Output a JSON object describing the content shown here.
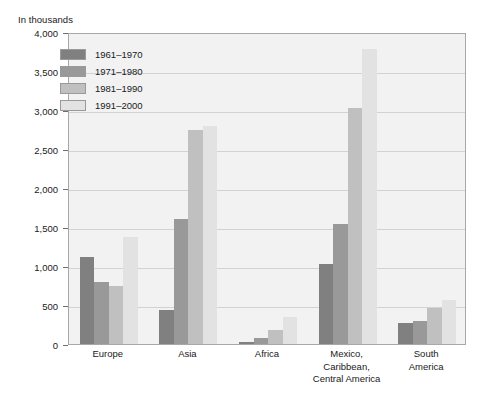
{
  "chart_data": {
    "type": "bar",
    "title": "",
    "subtitle": "",
    "axis_unit_caption": "In thousands",
    "xlabel": "",
    "ylabel": "",
    "ylim": [
      0,
      4000
    ],
    "ytick_values": [
      0,
      500,
      1000,
      1500,
      2000,
      2500,
      3000,
      3500,
      4000
    ],
    "ytick_labels": [
      "0",
      "500",
      "1,000",
      "1,500",
      "2,000",
      "2,500",
      "3,000",
      "3,500",
      "4,000"
    ],
    "grid": true,
    "grid_axis": "y",
    "legend_position": "top-left-inside",
    "categories": [
      "Europe",
      "Asia",
      "Africa",
      "Mexico,\nCaribbean,\nCentral America",
      "South\nAmerica"
    ],
    "series": [
      {
        "name": "1961–1970",
        "color": "#808080",
        "values": [
          1120,
          430,
          30,
          1030,
          270
        ]
      },
      {
        "name": "1971–1980",
        "color": "#999999",
        "values": [
          800,
          1600,
          80,
          1540,
          300
        ]
      },
      {
        "name": "1981–1990",
        "color": "#c0c0c0",
        "values": [
          740,
          2750,
          180,
          3020,
          460
        ]
      },
      {
        "name": "1991–2000",
        "color": "#e2e2e2",
        "values": [
          1370,
          2800,
          350,
          3780,
          560
        ]
      }
    ]
  },
  "colors": {
    "plot_background": "#f2f2f2",
    "plot_border": "#a8a8a8",
    "gridline": "#d2d2d2",
    "text": "#1a1a1a",
    "page_background": "#ffffff"
  }
}
